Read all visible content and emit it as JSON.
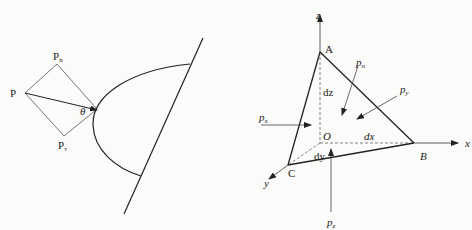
{
  "left_figure": {
    "labels": {
      "P": "P",
      "Pn": "P",
      "Pn_sub": "n",
      "Pt": "P",
      "Pt_sub": "τ",
      "theta": "θ"
    }
  },
  "right_figure": {
    "axes": {
      "x": "x",
      "y": "y",
      "z": "z"
    },
    "points": {
      "A": "A",
      "B": "B",
      "C": "C",
      "O": "O"
    },
    "lengths": {
      "dx": "dx",
      "dy": "dy",
      "dz": "dz"
    },
    "pressures": {
      "px": "p",
      "px_sub": "x",
      "py": "p",
      "py_sub": "y",
      "pz": "p",
      "pz_sub": "z",
      "pn": "p",
      "pn_sub": "n"
    }
  },
  "colors": {
    "stroke": "#222222",
    "thin": "#555555",
    "background": "#fbfbfa"
  }
}
